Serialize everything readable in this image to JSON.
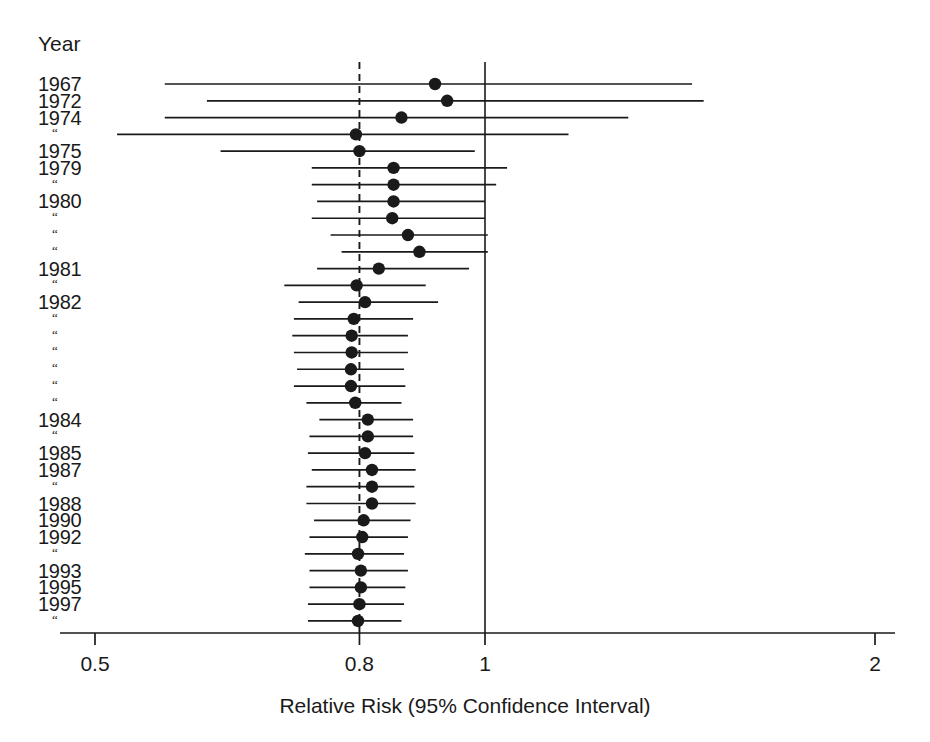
{
  "figure": {
    "year_column_header": "Year",
    "axis_title": "Relative Risk (95% Confidence Interval)",
    "ditto_mark": "“",
    "colors": {
      "ink": "#1a1a1a",
      "background": "#ffffff"
    }
  },
  "chart_data": {
    "type": "scatter",
    "subtype": "forest-plot",
    "title": "",
    "xlabel": "Relative Risk (95% Confidence Interval)",
    "ylabel": "Year",
    "xscale": "log",
    "xlim": [
      0.5,
      2.0
    ],
    "xticks": [
      0.5,
      0.8,
      1.0,
      2.0
    ],
    "xticklabels": [
      "0.5",
      "0.8",
      "1",
      "2"
    ],
    "grid": false,
    "legend": false,
    "reference_lines": [
      {
        "x": 0.8,
        "style": "dashed",
        "label": "pooled estimate"
      },
      {
        "x": 1.0,
        "style": "solid",
        "label": "null effect"
      }
    ],
    "ylabels": [
      "1967",
      "1972",
      "1974",
      "“",
      "1975",
      "1979",
      "“",
      "1980",
      "“",
      "“",
      "“",
      "1981",
      "“",
      "1982",
      "“",
      "“",
      "“",
      "“",
      "“",
      "“",
      "1984",
      "“",
      "1985",
      "1987",
      "“",
      "1988",
      "1990",
      "1992",
      "“",
      "1993",
      "1995",
      "1997",
      "“"
    ],
    "series": [
      {
        "name": "Relative Risk (95% CI)",
        "marker": "filled-circle",
        "points": [
          {
            "label": "1967",
            "rr": 0.915,
            "ci_low": 0.566,
            "ci_high": 1.445
          },
          {
            "label": "1972",
            "rr": 0.935,
            "ci_low": 0.61,
            "ci_high": 1.475
          },
          {
            "label": "1974",
            "rr": 0.862,
            "ci_low": 0.566,
            "ci_high": 1.29
          },
          {
            "label": "“",
            "rr": 0.795,
            "ci_low": 0.52,
            "ci_high": 1.16
          },
          {
            "label": "1975",
            "rr": 0.8,
            "ci_low": 0.625,
            "ci_high": 0.982
          },
          {
            "label": "1979",
            "rr": 0.85,
            "ci_low": 0.735,
            "ci_high": 1.04
          },
          {
            "label": "“",
            "rr": 0.85,
            "ci_low": 0.735,
            "ci_high": 1.02
          },
          {
            "label": "1980",
            "rr": 0.85,
            "ci_low": 0.742,
            "ci_high": 1.0
          },
          {
            "label": "“",
            "rr": 0.848,
            "ci_low": 0.735,
            "ci_high": 1.0
          },
          {
            "label": "“",
            "rr": 0.872,
            "ci_low": 0.76,
            "ci_high": 1.005
          },
          {
            "label": "“",
            "rr": 0.89,
            "ci_low": 0.775,
            "ci_high": 1.005
          },
          {
            "label": "1981",
            "rr": 0.828,
            "ci_low": 0.742,
            "ci_high": 0.972
          },
          {
            "label": "“",
            "rr": 0.796,
            "ci_low": 0.7,
            "ci_high": 0.9
          },
          {
            "label": "1982",
            "rr": 0.808,
            "ci_low": 0.718,
            "ci_high": 0.92
          },
          {
            "label": "“",
            "rr": 0.792,
            "ci_low": 0.712,
            "ci_high": 0.88
          },
          {
            "label": "“",
            "rr": 0.789,
            "ci_low": 0.71,
            "ci_high": 0.872
          },
          {
            "label": "“",
            "rr": 0.789,
            "ci_low": 0.712,
            "ci_high": 0.872
          },
          {
            "label": "“",
            "rr": 0.788,
            "ci_low": 0.716,
            "ci_high": 0.866
          },
          {
            "label": "“",
            "rr": 0.788,
            "ci_low": 0.712,
            "ci_high": 0.868
          },
          {
            "label": "“",
            "rr": 0.794,
            "ci_low": 0.728,
            "ci_high": 0.862
          },
          {
            "label": "1984",
            "rr": 0.812,
            "ci_low": 0.745,
            "ci_high": 0.88
          },
          {
            "label": "“",
            "rr": 0.812,
            "ci_low": 0.732,
            "ci_high": 0.88
          },
          {
            "label": "1985",
            "rr": 0.808,
            "ci_low": 0.73,
            "ci_high": 0.882
          },
          {
            "label": "1987",
            "rr": 0.818,
            "ci_low": 0.735,
            "ci_high": 0.884
          },
          {
            "label": "“",
            "rr": 0.818,
            "ci_low": 0.728,
            "ci_high": 0.882
          },
          {
            "label": "1988",
            "rr": 0.818,
            "ci_low": 0.728,
            "ci_high": 0.884
          },
          {
            "label": "1990",
            "rr": 0.806,
            "ci_low": 0.738,
            "ci_high": 0.876
          },
          {
            "label": "1992",
            "rr": 0.804,
            "ci_low": 0.732,
            "ci_high": 0.872
          },
          {
            "label": "“",
            "rr": 0.798,
            "ci_low": 0.726,
            "ci_high": 0.866
          },
          {
            "label": "1993",
            "rr": 0.802,
            "ci_low": 0.732,
            "ci_high": 0.872
          },
          {
            "label": "1995",
            "rr": 0.802,
            "ci_low": 0.732,
            "ci_high": 0.868
          },
          {
            "label": "1997",
            "rr": 0.8,
            "ci_low": 0.73,
            "ci_high": 0.866
          },
          {
            "label": "“",
            "rr": 0.798,
            "ci_low": 0.73,
            "ci_high": 0.862
          }
        ]
      }
    ]
  }
}
